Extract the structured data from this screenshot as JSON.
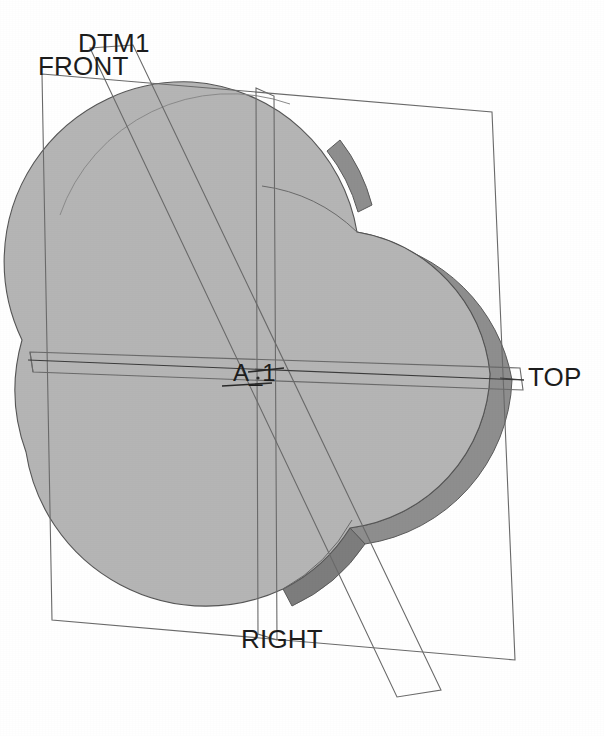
{
  "viewport": {
    "name": "cad-3d-viewport",
    "background_color": "#ffffff",
    "width": 604,
    "height": 736
  },
  "model": {
    "description": "Extruded trefoil (three overlapping circular lobes) solid",
    "face_color": "#b5b5b5",
    "side_wall_color": "#8e8e8e",
    "edge_color": "#555555",
    "lobes": [
      {
        "name": "upper-left-lobe",
        "cx": 192,
        "cy": 262,
        "r": 180
      },
      {
        "name": "lower-left-lobe",
        "cx": 207,
        "cy": 450,
        "r": 180
      },
      {
        "name": "right-lobe",
        "cx": 345,
        "cy": 375,
        "r": 170
      }
    ]
  },
  "datum_planes": [
    {
      "id": "front-plane",
      "label": "FRONT",
      "label_x": 38,
      "label_y": 75,
      "color": "#5a5a5a"
    },
    {
      "id": "dtm1-plane",
      "label": "DTM1",
      "label_x": 78,
      "label_y": 52,
      "color": "#5a5a5a"
    },
    {
      "id": "top-plane",
      "label": "TOP",
      "label_x": 528,
      "label_y": 386,
      "color": "#5a5a5a"
    },
    {
      "id": "right-plane",
      "label": "RIGHT",
      "label_x": 241,
      "label_y": 648,
      "color": "#5a5a5a"
    }
  ],
  "axes": [
    {
      "id": "axis-a1",
      "label": "A_1",
      "label_x": 233,
      "label_y": 381,
      "color": "#333333"
    }
  ],
  "labels": {
    "front": "FRONT",
    "dtm1": "DTM1",
    "top": "TOP",
    "right": "RIGHT",
    "axis_a1": "A_1"
  }
}
